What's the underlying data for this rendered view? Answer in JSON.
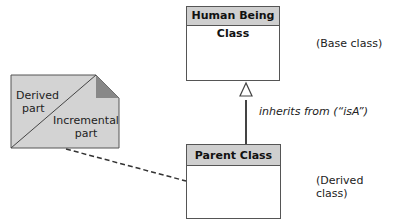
{
  "classes": {
    "base": {
      "name": "Human Being Class",
      "annotation": "(Base class)"
    },
    "derived": {
      "name": "Parent Class",
      "annotation": "(Derived class)"
    }
  },
  "relationship": {
    "label": "inherits from (“isA”)"
  },
  "note": {
    "top_text": "Derived part",
    "top_line1": "Derived",
    "top_line2": "part",
    "bottom_line1": "Incremental",
    "bottom_line2": "part"
  },
  "colors": {
    "header": "#cfcfcf",
    "note_fill": "#d3d3d3",
    "note_fold": "#888888",
    "line": "#444444"
  }
}
